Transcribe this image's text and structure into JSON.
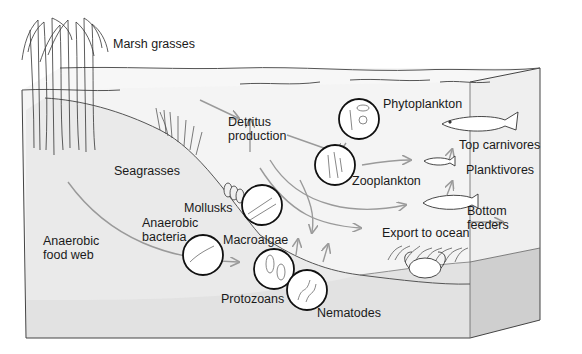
{
  "diagram": {
    "labels": {
      "marsh_grasses": "Marsh grasses",
      "detritus_production": "Detritus production",
      "phytoplankton": "Phytoplankton",
      "top_carnivores": "Top carnivores",
      "seagrasses": "Seagrasses",
      "zooplankton": "Zooplankton",
      "planktivores": "Planktivores",
      "mollusks": "Mollusks",
      "anaerobic_bacteria": "Anaerobic bacteria",
      "macroalgae": "Macroalgae",
      "bottom_feeders": "Bottom feeders",
      "anaerobic_food_web": "Anaerobic food web",
      "export_to_ocean": "Export to ocean",
      "protozoans": "Protozoans",
      "nematodes": "Nematodes"
    },
    "colors": {
      "water": "#f4f4f4",
      "sediment": "#e2e2e2",
      "sediment_side": "#cfcfcf",
      "outline": "#333333",
      "arrow": "#9a9a9a",
      "text": "#1a1a1a"
    }
  }
}
